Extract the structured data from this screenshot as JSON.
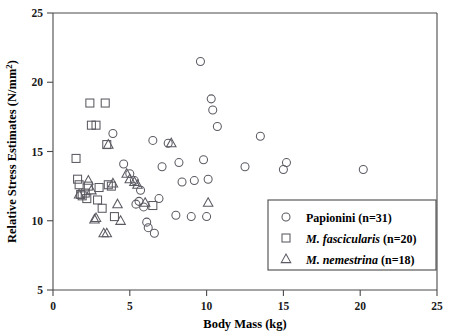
{
  "chart_data": {
    "type": "scatter",
    "title": "",
    "xlabel": "Body Mass (kg)",
    "ylabel_line1": "Relative Stress Estimates (N/mm",
    "ylabel_exp": "2",
    "ylabel_close": ")",
    "ylabel": "Relative Stress Estimates (N/mm2)",
    "xlim": [
      0,
      25
    ],
    "ylim": [
      5,
      25
    ],
    "xticks": [
      0,
      5,
      10,
      15,
      20,
      25
    ],
    "yticks": [
      5,
      10,
      15,
      20,
      25
    ],
    "xtick_labels": [
      "0",
      "5",
      "10",
      "15",
      "20",
      "25"
    ],
    "ytick_labels": [
      "5",
      "10",
      "15",
      "20",
      "25"
    ],
    "grid": false,
    "legend_position": "lower-right",
    "marker_color": "#5a5a62",
    "series": [
      {
        "name": "Papionini (n=31)",
        "label_plain": "Papionini",
        "label_italic": "",
        "count": "(n=31)",
        "marker": "circle",
        "points": [
          [
            3.9,
            16.3
          ],
          [
            4.6,
            14.1
          ],
          [
            5.0,
            13.4
          ],
          [
            5.3,
            12.9
          ],
          [
            5.4,
            11.2
          ],
          [
            5.6,
            11.4
          ],
          [
            5.7,
            12.2
          ],
          [
            5.9,
            11.0
          ],
          [
            6.1,
            9.9
          ],
          [
            6.2,
            9.5
          ],
          [
            6.5,
            15.8
          ],
          [
            6.6,
            9.1
          ],
          [
            6.9,
            11.6
          ],
          [
            7.1,
            13.9
          ],
          [
            7.5,
            15.6
          ],
          [
            8.0,
            10.4
          ],
          [
            8.2,
            14.2
          ],
          [
            8.4,
            12.8
          ],
          [
            9.0,
            10.3
          ],
          [
            9.2,
            12.9
          ],
          [
            9.6,
            21.5
          ],
          [
            9.8,
            14.4
          ],
          [
            10.0,
            10.3
          ],
          [
            10.1,
            13.0
          ],
          [
            10.3,
            18.8
          ],
          [
            10.4,
            18.0
          ],
          [
            10.7,
            16.8
          ],
          [
            12.5,
            13.9
          ],
          [
            13.5,
            16.1
          ],
          [
            15.0,
            13.7
          ],
          [
            15.2,
            14.2
          ],
          [
            20.2,
            13.7
          ]
        ]
      },
      {
        "name": "M. fascicularis (n=20)",
        "label_plain": "",
        "label_italic": "M. fascicularis",
        "count": "(n=20)",
        "marker": "square",
        "points": [
          [
            1.5,
            14.5
          ],
          [
            1.6,
            13.0
          ],
          [
            1.7,
            12.6
          ],
          [
            1.8,
            11.9
          ],
          [
            1.9,
            11.8
          ],
          [
            2.1,
            12.0
          ],
          [
            2.2,
            11.6
          ],
          [
            2.3,
            12.5
          ],
          [
            2.4,
            18.5
          ],
          [
            2.5,
            16.9
          ],
          [
            2.8,
            16.9
          ],
          [
            2.9,
            11.5
          ],
          [
            3.0,
            12.4
          ],
          [
            3.2,
            10.9
          ],
          [
            3.4,
            18.5
          ],
          [
            3.5,
            15.5
          ],
          [
            3.6,
            12.6
          ],
          [
            3.8,
            12.5
          ],
          [
            4.0,
            10.3
          ],
          [
            6.5,
            11.1
          ]
        ]
      },
      {
        "name": "M. nemestrina (n=18)",
        "label_plain": "",
        "label_italic": "M. nemestrina",
        "count": "(n=18)",
        "marker": "triangle",
        "points": [
          [
            1.7,
            11.9
          ],
          [
            2.3,
            12.9
          ],
          [
            2.5,
            12.2
          ],
          [
            2.7,
            10.1
          ],
          [
            2.8,
            10.2
          ],
          [
            3.3,
            9.1
          ],
          [
            3.5,
            9.1
          ],
          [
            3.6,
            15.5
          ],
          [
            3.9,
            12.7
          ],
          [
            4.2,
            11.2
          ],
          [
            4.4,
            10.0
          ],
          [
            4.8,
            13.4
          ],
          [
            5.0,
            13.0
          ],
          [
            5.3,
            12.8
          ],
          [
            5.5,
            12.6
          ],
          [
            6.0,
            11.3
          ],
          [
            7.7,
            15.6
          ],
          [
            10.1,
            11.3
          ]
        ]
      }
    ]
  }
}
